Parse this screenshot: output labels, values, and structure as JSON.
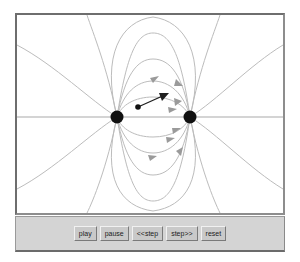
{
  "app": {
    "title": "Electric Dipole Field Applet",
    "background_color": "#ffffff"
  },
  "canvas": {
    "name": "field-simulation-canvas",
    "background_color": "#ffffff",
    "border_color": "#6e6e6e",
    "width": 270,
    "height": 202,
    "fieldline_color": "#b9b9b9",
    "axis_color": "#a8a8a8",
    "charge_color": "#111111",
    "particle_color": "#111111",
    "vector_color": "#202020",
    "charges": [
      {
        "label": "charge-left",
        "cx": 100,
        "cy": 102,
        "r": 6.5
      },
      {
        "label": "charge-right",
        "cx": 173,
        "cy": 102,
        "r": 6.5
      }
    ],
    "test_particle": {
      "label": "test-particle",
      "cx": 121,
      "cy": 92,
      "r": 2.6
    },
    "force_vector": {
      "label": "force-vector",
      "x1": 121,
      "y1": 92,
      "x2": 150,
      "y2": 79
    },
    "axis_line": {
      "x1": 0,
      "y1": 102,
      "x2": 270,
      "y2": 102
    }
  },
  "controls": {
    "panel_color": "#d4d4d4",
    "buttons": [
      {
        "name": "play-button",
        "label": "play"
      },
      {
        "name": "pause-button",
        "label": "pause"
      },
      {
        "name": "step-back-button",
        "label": "<<step"
      },
      {
        "name": "step-fwd-button",
        "label": "step>>"
      },
      {
        "name": "reset-button",
        "label": "reset"
      }
    ]
  }
}
